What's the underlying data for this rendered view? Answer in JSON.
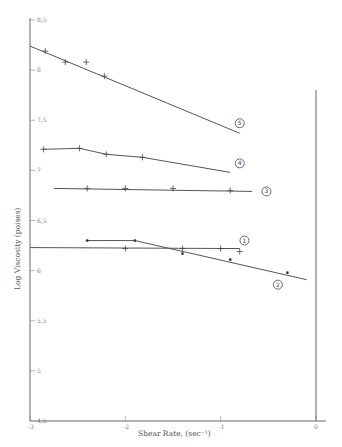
{
  "chart_data": {
    "type": "line",
    "title": "",
    "xlabel": "Shear Rate, (sec⁻¹)",
    "ylabel": "Log Viscosity (poises)",
    "xlim": [
      -3,
      0
    ],
    "ylim": [
      4.5,
      8.5
    ],
    "x_ticks": [
      -3,
      -2,
      -1,
      0
    ],
    "x_tick_labels": [
      "-3",
      "-2",
      "-1",
      "0"
    ],
    "y_ticks": [
      4.5,
      5,
      5.5,
      6,
      6.5,
      7,
      7.5,
      8,
      8.5
    ],
    "y_tick_labels": [
      "4,5",
      "5",
      "5,5",
      "6",
      "6,5",
      "7",
      "7,5",
      "8",
      "8,5"
    ],
    "grid": false,
    "legend": "circled numbers beside each curve",
    "series": [
      {
        "name": "1",
        "marker": "+",
        "points": [
          [
            -2.0,
            6.22
          ],
          [
            -1.4,
            6.22
          ],
          [
            -1.0,
            6.22
          ],
          [
            -0.8,
            6.19
          ]
        ],
        "line": [
          [
            -3.0,
            6.23
          ],
          [
            -0.8,
            6.22
          ]
        ],
        "label_pos": [
          -0.75,
          6.3
        ]
      },
      {
        "name": "2",
        "marker": "dot",
        "points": [
          [
            -2.4,
            6.3
          ],
          [
            -1.9,
            6.3
          ],
          [
            -1.4,
            6.17
          ],
          [
            -0.9,
            6.11
          ],
          [
            -0.3,
            5.98
          ]
        ],
        "line": [
          [
            -2.4,
            6.3
          ],
          [
            -1.9,
            6.3
          ],
          [
            -0.1,
            5.91
          ]
        ],
        "label_pos": [
          -0.4,
          5.86
        ]
      },
      {
        "name": "3",
        "marker": "+",
        "points": [
          [
            -2.4,
            6.82
          ],
          [
            -2.0,
            6.82
          ],
          [
            -1.5,
            6.82
          ],
          [
            -0.9,
            6.8
          ]
        ],
        "line": [
          [
            -2.75,
            6.82
          ],
          [
            -0.67,
            6.79
          ]
        ],
        "label_pos": [
          -0.52,
          6.79
        ]
      },
      {
        "name": "4",
        "marker": "+",
        "points": [
          [
            -2.86,
            7.21
          ],
          [
            -2.48,
            7.22
          ],
          [
            -2.2,
            7.16
          ],
          [
            -1.82,
            7.13
          ]
        ],
        "line": [
          [
            -2.86,
            7.21
          ],
          [
            -2.48,
            7.22
          ],
          [
            -2.2,
            7.16
          ],
          [
            -1.82,
            7.13
          ],
          [
            -0.9,
            6.98
          ]
        ],
        "label_pos": [
          -0.8,
          7.07
        ]
      },
      {
        "name": "5",
        "marker": "+",
        "points": [
          [
            -2.84,
            8.19
          ],
          [
            -2.63,
            8.08
          ],
          [
            -2.41,
            8.08
          ],
          [
            -2.22,
            7.94
          ]
        ],
        "line": [
          [
            -3.0,
            8.24
          ],
          [
            -0.8,
            7.37
          ]
        ],
        "label_pos": [
          -0.8,
          7.47
        ]
      }
    ]
  }
}
